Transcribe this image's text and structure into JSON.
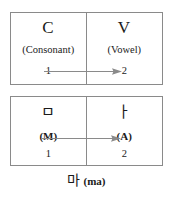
{
  "diagram": {
    "colors": {
      "border": "#8a8a8a",
      "arrow": "#8a8a8a",
      "text": "#1a1a1a",
      "background": "#ffffff"
    },
    "schema_box": {
      "left_cell": {
        "symbol": "C",
        "name": "(Consonant)",
        "index": "1"
      },
      "right_cell": {
        "symbol": "V",
        "name": "(Vowel)",
        "index": "2"
      },
      "arrow": "arrow-right"
    },
    "example_box": {
      "left_cell": {
        "symbol": "ㅁ",
        "name": "(M)",
        "index": "1"
      },
      "right_cell": {
        "symbol": "ㅏ",
        "name": "(A)",
        "index": "2"
      },
      "arrow": "arrow-right"
    },
    "caption": {
      "syllable": "마",
      "romanization": "(ma)"
    }
  }
}
